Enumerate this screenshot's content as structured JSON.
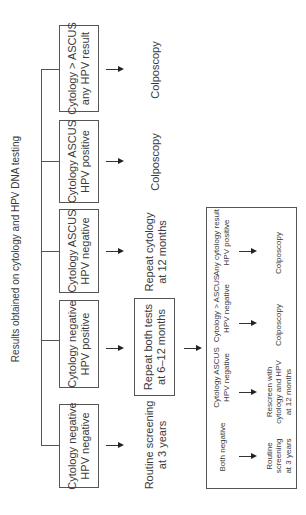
{
  "title": "Results obtained on cytology and HPV DNA testing",
  "results": [
    {
      "line1": "Cytology > ASCUS",
      "line2": "any HPV result",
      "outcome_line1": "Colposcopy",
      "outcome_line2": ""
    },
    {
      "line1": "Cytology ASCUS",
      "line2": "HPV positive",
      "outcome_line1": "Colposcopy",
      "outcome_line2": ""
    },
    {
      "line1": "Cytology ASCUS",
      "line2": "HPV negative",
      "outcome_line1": "Repeat cytology",
      "outcome_line2": "at 12 months"
    },
    {
      "line1": "Cytology negative",
      "line2": "HPV positive",
      "outcome_line1": "Repeat both tests",
      "outcome_line2": "at 6–12 months"
    },
    {
      "line1": "Cytology negative",
      "line2": "HPV negative",
      "outcome_line1": "Routine screening",
      "outcome_line2": "at 3 years"
    }
  ],
  "followup": [
    {
      "cond_line1": "Both negative",
      "cond_line2": "",
      "out_line1": "Routine",
      "out_line2": "screening",
      "out_line3": "at 3 years"
    },
    {
      "cond_line1": "Cytology ASCUS",
      "cond_line2": "HPV negative",
      "out_line1": "Rescreen with",
      "out_line2": "cytology and HPV",
      "out_line3": "at 12 months"
    },
    {
      "cond_line1": "Cytology > ASCUS",
      "cond_line2": "HPV negative",
      "out_line1": "Colposcopy",
      "out_line2": "",
      "out_line3": ""
    },
    {
      "cond_line1": "Any cytology result",
      "cond_line2": "HPV positive",
      "out_line1": "Colposcopy",
      "out_line2": "",
      "out_line3": ""
    }
  ]
}
